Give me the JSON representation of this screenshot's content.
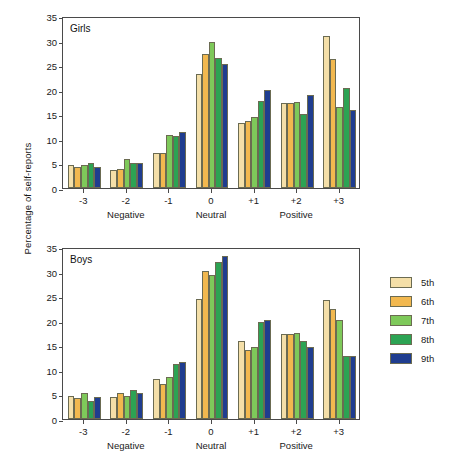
{
  "figure": {
    "ylabel": "Percentage of self-reports"
  },
  "chart_data": [
    {
      "type": "bar",
      "title": "Girls",
      "xlabel": "",
      "ylabel": "Percentage of self-reports",
      "ylim": [
        0,
        35
      ],
      "yticks": [
        0,
        5,
        10,
        15,
        20,
        25,
        30,
        35
      ],
      "grid": false,
      "categories": [
        "-3",
        "-2",
        "-1",
        "0",
        "+1",
        "+2",
        "+3"
      ],
      "category_groups": [
        {
          "label": "Negative",
          "categories": [
            "-3",
            "-2",
            "-1"
          ]
        },
        {
          "label": "Neutral",
          "categories": [
            "0"
          ]
        },
        {
          "label": "Positive",
          "categories": [
            "+1",
            "+2",
            "+3"
          ]
        }
      ],
      "series": [
        {
          "name": "5th",
          "color": "#f4dfa8",
          "values": [
            4.6,
            3.7,
            7.2,
            23.1,
            13.2,
            17.2,
            31.0
          ]
        },
        {
          "name": "6th",
          "color": "#f2b84f",
          "values": [
            4.2,
            3.8,
            7.2,
            27.2,
            13.6,
            17.3,
            26.2
          ]
        },
        {
          "name": "7th",
          "color": "#7ec95a",
          "values": [
            4.6,
            5.9,
            10.8,
            29.7,
            14.4,
            17.5,
            16.4
          ]
        },
        {
          "name": "8th",
          "color": "#2ca353",
          "values": [
            5.0,
            5.0,
            10.5,
            26.5,
            17.8,
            15.0,
            20.4
          ]
        },
        {
          "name": "9th",
          "color": "#1f3d8f",
          "values": [
            4.3,
            5.1,
            11.3,
            25.2,
            20.0,
            19.0,
            15.8
          ]
        }
      ]
    },
    {
      "type": "bar",
      "title": "Boys",
      "xlabel": "",
      "ylabel": "Percentage of self-reports",
      "ylim": [
        0,
        35
      ],
      "yticks": [
        0,
        5,
        10,
        15,
        20,
        25,
        30,
        35
      ],
      "grid": false,
      "categories": [
        "-3",
        "-2",
        "-1",
        "0",
        "+1",
        "+2",
        "+3"
      ],
      "category_groups": [
        {
          "label": "Negative",
          "categories": [
            "-3",
            "-2",
            "-1"
          ]
        },
        {
          "label": "Neutral",
          "categories": [
            "0"
          ]
        },
        {
          "label": "Positive",
          "categories": [
            "+1",
            "+2",
            "+3"
          ]
        }
      ],
      "series": [
        {
          "name": "5th",
          "color": "#f4dfa8",
          "values": [
            4.7,
            4.4,
            8.2,
            24.5,
            15.8,
            17.2,
            24.2
          ]
        },
        {
          "name": "6th",
          "color": "#f2b84f",
          "values": [
            4.2,
            5.3,
            7.2,
            30.2,
            14.0,
            17.2,
            22.4
          ]
        },
        {
          "name": "7th",
          "color": "#7ec95a",
          "values": [
            5.3,
            4.6,
            8.6,
            29.4,
            14.7,
            17.6,
            20.2
          ]
        },
        {
          "name": "8th",
          "color": "#2ca353",
          "values": [
            3.6,
            6.0,
            11.1,
            31.9,
            19.7,
            15.8,
            12.9
          ]
        },
        {
          "name": "9th",
          "color": "#1f3d8f",
          "values": [
            4.4,
            5.2,
            11.6,
            33.2,
            20.1,
            14.6,
            12.9
          ]
        }
      ]
    }
  ],
  "legend": {
    "position": "right",
    "entries": [
      {
        "label": "5th",
        "color": "#f4dfa8"
      },
      {
        "label": "6th",
        "color": "#f2b84f"
      },
      {
        "label": "7th",
        "color": "#7ec95a"
      },
      {
        "label": "8th",
        "color": "#2ca353"
      },
      {
        "label": "9th",
        "color": "#1f3d8f"
      }
    ]
  }
}
